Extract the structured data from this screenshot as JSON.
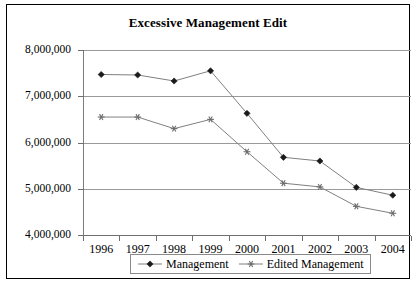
{
  "chart_data": {
    "type": "line",
    "title": "Excessive Management Edit",
    "xlabel": "",
    "ylabel": "",
    "categories": [
      "1996",
      "1997",
      "1998",
      "1999",
      "2000",
      "2001",
      "2002",
      "2003",
      "2004"
    ],
    "series": [
      {
        "name": "Management",
        "marker": "diamond",
        "values": [
          7470000,
          7460000,
          7330000,
          7550000,
          6630000,
          5680000,
          5600000,
          5030000,
          4860000
        ]
      },
      {
        "name": "Edited Management",
        "marker": "star",
        "values": [
          6550000,
          6550000,
          6300000,
          6500000,
          5800000,
          5120000,
          5040000,
          4620000,
          4470000
        ]
      }
    ],
    "ylim": [
      4000000,
      8000000
    ],
    "ytick_labels": [
      "8,000,000",
      "7,000,000",
      "6,000,000",
      "5,000,000",
      "4,000,000"
    ],
    "ytick_values": [
      8000000,
      7000000,
      6000000,
      5000000,
      4000000
    ],
    "grid": true,
    "legend_position": "bottom",
    "colors": {
      "line": "#808080",
      "grid": "#9a9a9a",
      "axis": "#6e6e6e",
      "marker_primary": "#1a1a1a",
      "marker_secondary": "#6b6b6b",
      "border": "#000000",
      "background": "#ffffff"
    }
  },
  "legend": {
    "items": [
      {
        "label": "Management",
        "marker": "diamond-marker-icon"
      },
      {
        "label": "Edited Management",
        "marker": "star-marker-icon"
      }
    ]
  }
}
